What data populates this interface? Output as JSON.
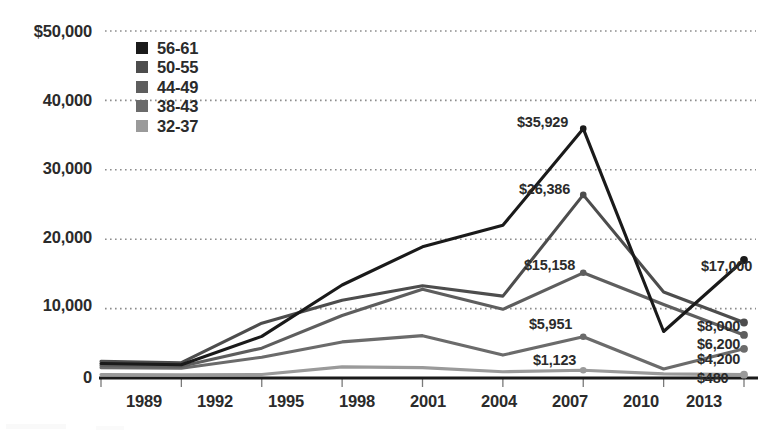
{
  "chart_data": {
    "type": "line",
    "title": "",
    "xlabel": "",
    "ylabel": "",
    "categories": [
      "1989",
      "1992",
      "1995",
      "1998",
      "2001",
      "2004",
      "2007",
      "2010",
      "2013"
    ],
    "ylim": [
      0,
      50000
    ],
    "yticks": [
      0,
      10000,
      20000,
      30000,
      40000,
      50000
    ],
    "ytick_labels": [
      "0",
      "10,000",
      "20,000",
      "30,000",
      "40,000",
      "$50,000"
    ],
    "grid": "horizontal-dotted",
    "legend_position": "upper-left-inside",
    "series": [
      {
        "name": "56-61",
        "color": "#1a1a1a",
        "values": [
          2100,
          1900,
          6000,
          13400,
          18900,
          22000,
          35929,
          6700,
          17000
        ],
        "peak_label": "$35,929",
        "peak_index": 6,
        "end_label": "$17,000"
      },
      {
        "name": "50-55",
        "color": "#4d4d4d",
        "values": [
          2400,
          2200,
          7900,
          11200,
          13300,
          11800,
          26386,
          12400,
          8000
        ],
        "peak_label": "$26,386",
        "peak_index": 6,
        "end_label": "$8,000"
      },
      {
        "name": "44-49",
        "color": "#5e5e5e",
        "values": [
          1800,
          1700,
          4300,
          9000,
          12800,
          9900,
          15158,
          10600,
          6200
        ],
        "peak_label": "$15,158",
        "peak_index": 6,
        "end_label": "$6,200"
      },
      {
        "name": "38-43",
        "color": "#6b6b6b",
        "values": [
          1500,
          1400,
          3000,
          5200,
          6100,
          3300,
          5951,
          1300,
          4200
        ],
        "peak_label": "$5,951",
        "peak_index": 6,
        "end_label": "$4,200"
      },
      {
        "name": "32-37",
        "color": "#9a9a9a",
        "values": [
          500,
          450,
          500,
          1600,
          1500,
          900,
          1123,
          600,
          480
        ],
        "peak_label": "$1,123",
        "peak_index": 6,
        "end_label": "$480"
      }
    ],
    "peak_annotations": [
      {
        "label": "$35,929",
        "series": "56-61",
        "x_px": 517,
        "y_px": 114
      },
      {
        "label": "$26,386",
        "series": "50-55",
        "x_px": 519,
        "y_px": 181
      },
      {
        "label": "$15,158",
        "series": "44-49",
        "x_px": 524,
        "y_px": 257
      },
      {
        "label": "$5,951",
        "series": "38-43",
        "x_px": 529,
        "y_px": 316
      },
      {
        "label": "$1,123",
        "series": "32-37",
        "x_px": 533,
        "y_px": 352
      }
    ],
    "end_annotations": [
      {
        "label": "$17,000",
        "series": "56-61",
        "x_px": 701,
        "y_px": 258
      },
      {
        "label": "$8,000",
        "series": "50-55",
        "x_px": 697,
        "y_px": 318
      },
      {
        "label": "$6,200",
        "series": "44-49",
        "x_px": 697,
        "y_px": 336
      },
      {
        "label": "$4,200",
        "series": "38-43",
        "x_px": 697,
        "y_px": 351
      },
      {
        "label": "$480",
        "series": "32-37",
        "x_px": 697,
        "y_px": 370
      }
    ]
  },
  "axis": {
    "y_labels": [
      {
        "text": "$50,000",
        "top": 22
      },
      {
        "text": "40,000",
        "top": 91
      },
      {
        "text": "30,000",
        "top": 159
      },
      {
        "text": "20,000",
        "top": 228
      },
      {
        "text": "10,000",
        "top": 296
      },
      {
        "text": "0",
        "top": 368
      }
    ],
    "x_labels": [
      {
        "text": "1989",
        "left": 112
      },
      {
        "text": "1992",
        "left": 183
      },
      {
        "text": "1995",
        "left": 254
      },
      {
        "text": "1998",
        "left": 325
      },
      {
        "text": "2001",
        "left": 396
      },
      {
        "text": "2004",
        "left": 467
      },
      {
        "text": "2007",
        "left": 538
      },
      {
        "text": "2010",
        "left": 609
      },
      {
        "text": "2013",
        "left": 672
      }
    ]
  },
  "legend": {
    "items": [
      {
        "label": "56-61",
        "color": "#1a1a1a"
      },
      {
        "label": "50-55",
        "color": "#4d4d4d"
      },
      {
        "label": "44-49",
        "color": "#5e5e5e"
      },
      {
        "label": "38-43",
        "color": "#6b6b6b"
      },
      {
        "label": "32-37",
        "color": "#9a9a9a"
      }
    ]
  }
}
